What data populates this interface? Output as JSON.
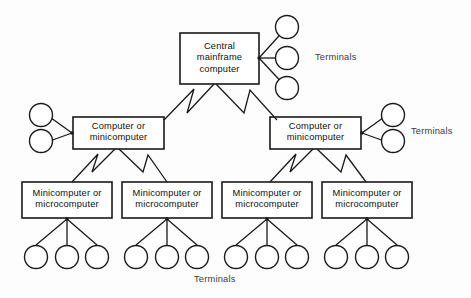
{
  "diagram": {
    "background_color": "#fdfdfd",
    "line_color": "#1a1a1a",
    "text_color": "#111111",
    "nodes": {
      "mainframe": {
        "label": "Central\nmainframe\ncomputer",
        "line1": "Central",
        "line2": "mainframe",
        "line3": "computer"
      },
      "mid_left": {
        "label": "Computer or\nminicomputer",
        "line1": "Computer or",
        "line2": "minicomputer"
      },
      "mid_right": {
        "label": "Computer or\nminicomputer",
        "line1": "Computer or",
        "line2": "minicomputer"
      },
      "leaf_1": {
        "label": "Minicomputer or\nmicrocomputer",
        "line1": "Minicomputer or",
        "line2": "microcomputer"
      },
      "leaf_2": {
        "label": "Minicomputer or\nmicrocomputer",
        "line1": "Minicomputer or",
        "line2": "microcomputer"
      },
      "leaf_3": {
        "label": "Minicomputer or\nmicrocomputer",
        "line1": "Minicomputer or",
        "line2": "microcomputer"
      },
      "leaf_4": {
        "label": "Minicomputer or\nmicrocomputer",
        "line1": "Minicomputer or",
        "line2": "microcomputer"
      }
    },
    "labels": {
      "terminals_mainframe": "Terminals",
      "terminals_mid_right": "Terminals",
      "terminals_bottom": "Terminals"
    },
    "terminal_counts": {
      "mainframe_right": 3,
      "mid_left_left": 2,
      "mid_right_right": 2,
      "leaf_1_below": 3,
      "leaf_2_below": 3,
      "leaf_3_below": 3,
      "leaf_4_below": 3
    }
  }
}
